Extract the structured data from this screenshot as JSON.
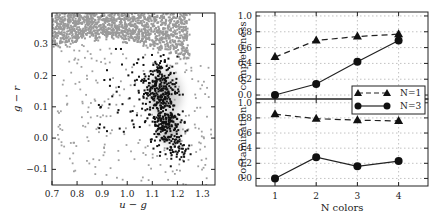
{
  "chart_data": [
    {
      "type": "scatter",
      "title": "",
      "xlabel": "u - g",
      "ylabel": "g - r",
      "xlim": [
        0.7,
        1.35
      ],
      "ylim": [
        -0.15,
        0.4
      ],
      "xticks": [
        "0.7",
        "0.8",
        "0.9",
        "1.0",
        "1.1",
        "1.2",
        "1.3"
      ],
      "yticks": [
        "-0.1",
        "0.0",
        "0.1",
        "0.2",
        "0.3"
      ],
      "grid": false,
      "series": [
        {
          "name": "background stars",
          "color": "#9a9a9a",
          "description": "dense grey locus at g-r > 0.25 plus scattered grey points"
        },
        {
          "name": "selected objects",
          "color": "#111111",
          "description": "black points concentrated near u-g 1.1-1.25, g-r -0.05-0.22"
        },
        {
          "name": "density shading",
          "color": "#bbbbbb",
          "description": "grey Gaussian halo around the black cluster"
        }
      ]
    },
    {
      "type": "line",
      "panel": "top",
      "ylabel": "completeness",
      "x": [
        1,
        2,
        3,
        4
      ],
      "ylim": [
        -0.05,
        1.05
      ],
      "yticks": [
        "0.0",
        "0.2",
        "0.4",
        "0.6",
        "0.8",
        "1.0"
      ],
      "grid": true,
      "series": [
        {
          "name": "N=1",
          "marker": "triangle",
          "linestyle": "dashed",
          "values": [
            0.48,
            0.69,
            0.74,
            0.77
          ]
        },
        {
          "name": "N=3",
          "marker": "circle",
          "linestyle": "solid",
          "values": [
            0.0,
            0.14,
            0.42,
            0.69
          ]
        }
      ]
    },
    {
      "type": "line",
      "panel": "bottom",
      "ylabel": "contamination",
      "xlabel": "N colors",
      "x": [
        1,
        2,
        3,
        4
      ],
      "xticks": [
        "1",
        "2",
        "3",
        "4"
      ],
      "ylim": [
        -0.1,
        1.05
      ],
      "yticks": [
        "0.0",
        "0.2",
        "0.4",
        "0.6",
        "0.8",
        "1.0"
      ],
      "grid": true,
      "series": [
        {
          "name": "N=1",
          "marker": "triangle",
          "linestyle": "dashed",
          "values": [
            0.85,
            0.79,
            0.77,
            0.76
          ]
        },
        {
          "name": "N=3",
          "marker": "circle",
          "linestyle": "solid",
          "values": [
            0.0,
            0.28,
            0.16,
            0.23
          ]
        }
      ]
    }
  ],
  "legend": {
    "position": "right, between top and bottom panels",
    "entries": [
      {
        "label": "N=1",
        "marker": "triangle",
        "linestyle": "dashed"
      },
      {
        "label": "N=3",
        "marker": "circle",
        "linestyle": "solid"
      }
    ]
  },
  "labels": {
    "left_xlabel": "u − g",
    "left_ylabel": "g − r",
    "top_ylabel": "completeness",
    "bottom_ylabel": "contamination",
    "bottom_xlabel": "N colors",
    "legend_n1": "N=1",
    "legend_n3": "N=3"
  }
}
